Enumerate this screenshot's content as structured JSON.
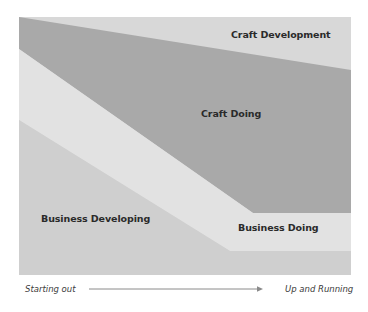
{
  "diagram": {
    "bands": [
      {
        "id": "craft-development",
        "label": "Craft Development",
        "color": "#d8d8d8",
        "label_pos": [
          231,
          38
        ]
      },
      {
        "id": "craft-doing",
        "label": "Craft Doing",
        "color": "#a9a9a9",
        "label_pos": [
          201,
          117
        ]
      },
      {
        "id": "business-doing",
        "label": "Business Doing",
        "color": "#e2e2e2",
        "label_pos": [
          238,
          231
        ]
      },
      {
        "id": "business-developing",
        "label": "Business Developing",
        "color": "#cfcfcf",
        "label_pos": [
          41,
          222
        ]
      }
    ],
    "axis": {
      "start_label": "Starting out",
      "end_label": "Up and Running",
      "arrow_color": "#8a8a8a"
    }
  }
}
